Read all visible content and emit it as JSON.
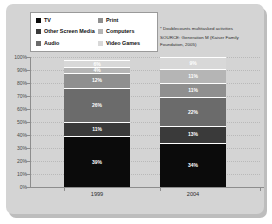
{
  "legend": {
    "items": [
      {
        "label": "TV",
        "color": "#0b0b0b"
      },
      {
        "label": "Print",
        "color": "#8f8f8f"
      },
      {
        "label": "Other Screen Media",
        "color": "#3a3a3a"
      },
      {
        "label": "Computers",
        "color": "#b5b5b5"
      },
      {
        "label": "Audio",
        "color": "#6b6b6b"
      },
      {
        "label": "Video Games",
        "color": "#d8d8d8"
      }
    ]
  },
  "notes": {
    "footnote": "* Doublecounts multitasked activities",
    "source_line1": "SOURCE: Generation M (Kaiser Family",
    "source_line2": "Foundation, 2005)"
  },
  "axis": {
    "yticks": [
      "100%",
      "90%",
      "80%",
      "70%",
      "60%",
      "50%",
      "40%",
      "30%",
      "20%",
      "10%",
      "0%"
    ]
  },
  "chart_data": {
    "type": "bar",
    "title": "",
    "subtitle": "",
    "xlabel": "",
    "ylabel": "",
    "ylim": [
      0,
      100
    ],
    "grid": true,
    "stacked": true,
    "normalized_percent": true,
    "legend_position": "top-left",
    "categories": [
      "1999",
      "2004"
    ],
    "series": [
      {
        "name": "TV",
        "color": "#0b0b0b",
        "values": [
          39,
          34
        ],
        "labels": [
          "39%",
          "34%"
        ]
      },
      {
        "name": "Other Screen Media",
        "color": "#3a3a3a",
        "values": [
          11,
          13
        ],
        "labels": [
          "11%",
          "13%"
        ]
      },
      {
        "name": "Audio",
        "color": "#6b6b6b",
        "values": [
          26,
          22
        ],
        "labels": [
          "26%",
          "22%"
        ]
      },
      {
        "name": "Print",
        "color": "#8f8f8f",
        "values": [
          12,
          11
        ],
        "labels": [
          "12%",
          "11%"
        ]
      },
      {
        "name": "Computers",
        "color": "#b5b5b5",
        "values": [
          4,
          11
        ],
        "labels": [
          "4%",
          "11%"
        ]
      },
      {
        "name": "Video Games",
        "color": "#d8d8d8",
        "values": [
          6,
          9
        ],
        "labels": [
          "6%",
          "9%"
        ]
      }
    ],
    "annotations": [
      "* Doublecounts multitasked activities",
      "SOURCE: Generation M (Kaiser Family Foundation, 2005)"
    ]
  }
}
